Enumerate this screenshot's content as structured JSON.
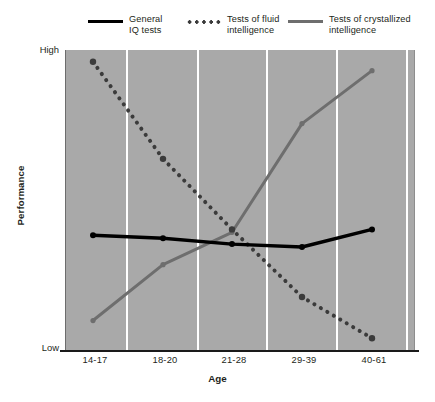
{
  "chart_data": {
    "type": "line",
    "title": "",
    "xlabel": "Age",
    "ylabel": "Performance",
    "categories": [
      "14-17",
      "18-20",
      "21-28",
      "29-39",
      "40-61"
    ],
    "ytick_labels": [
      "High",
      "Low"
    ],
    "ylim": [
      0,
      100
    ],
    "ylim_labels": [
      "Low",
      "High"
    ],
    "grid": "vertical-white-gridlines",
    "legend_position": "top",
    "series": [
      {
        "name": "General\nIQ tests",
        "style": "solid",
        "color": "#000000",
        "values": [
          38,
          37,
          35,
          34,
          40
        ]
      },
      {
        "name": "Tests of fluid\nintelligence",
        "style": "dotted",
        "color": "#3b3b3b",
        "values": [
          97,
          64,
          40,
          17,
          3
        ]
      },
      {
        "name": "Tests of crystallized\nintelligence",
        "style": "solid",
        "color": "#6e6e6e",
        "values": [
          9,
          28,
          39,
          76,
          94
        ]
      }
    ]
  },
  "axes": {
    "y_high_label": "High",
    "y_low_label": "Low",
    "y_title": "Performance",
    "x_title": "Age",
    "x_ticks": [
      "14-17",
      "18-20",
      "21-28",
      "29-39",
      "40-61"
    ]
  },
  "legend": {
    "items": [
      {
        "label": "General\nIQ tests",
        "style": "solid-black"
      },
      {
        "label": "Tests of fluid\nintelligence",
        "style": "dotted"
      },
      {
        "label": "Tests of crystallized\nintelligence",
        "style": "solid-grey"
      }
    ]
  },
  "colors": {
    "plot_background": "#a9a9a9",
    "gridline": "#ffffff",
    "axis": "#1a1a1a",
    "general_iq": "#000000",
    "fluid": "#3b3b3b",
    "crystallized": "#6e6e6e"
  }
}
